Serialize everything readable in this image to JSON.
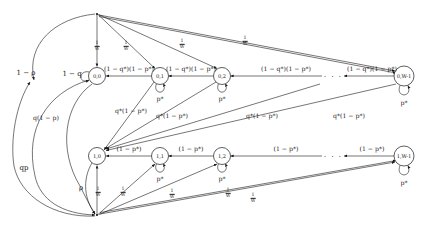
{
  "diagram": {
    "type": "state-transition-diagram",
    "ink_color": "#1a1a1a",
    "background": "#ffffff",
    "rows": [
      {
        "row_index": 0,
        "states": [
          {
            "id": "s00",
            "label": "0,0",
            "cx": 97,
            "cy": 76,
            "r": 8.5
          },
          {
            "id": "s01",
            "label": "0,1",
            "cx": 160,
            "cy": 76,
            "r": 8.5
          },
          {
            "id": "s02",
            "label": "0,2",
            "cx": 222,
            "cy": 76,
            "r": 8.5
          },
          {
            "id": "s0W",
            "label": "0,W-1",
            "cx": 404,
            "cy": 76,
            "r": 10
          }
        ]
      },
      {
        "row_index": 1,
        "states": [
          {
            "id": "s10",
            "label": "1,0",
            "cx": 97,
            "cy": 156,
            "r": 8.5
          },
          {
            "id": "s11",
            "label": "1,1",
            "cx": 160,
            "cy": 156,
            "r": 8.5
          },
          {
            "id": "s12",
            "label": "1,2",
            "cx": 222,
            "cy": 156,
            "r": 8.5
          },
          {
            "id": "s1W",
            "label": "1,W-1",
            "cx": 404,
            "cy": 156,
            "r": 10
          }
        ]
      }
    ],
    "ellipsis": [
      {
        "id": "dots-top",
        "text": "· · ·",
        "x": 333,
        "y": 76
      },
      {
        "id": "dots-bottom",
        "text": "· · ·",
        "x": 333,
        "y": 156
      }
    ],
    "self_loops": [
      {
        "id": "loop-00",
        "state": "0,0",
        "label": "1 − q",
        "lx": 72,
        "ly": 74,
        "side": "left"
      },
      {
        "id": "loop-01",
        "state": "0,1",
        "label": "p*",
        "lx": 160,
        "ly": 98,
        "side": "below"
      },
      {
        "id": "loop-02",
        "state": "0,2",
        "label": "p*",
        "lx": 222,
        "ly": 98,
        "side": "below"
      },
      {
        "id": "loop-0W",
        "state": "0,W-1",
        "label": "p*",
        "lx": 404,
        "ly": 102,
        "side": "below"
      },
      {
        "id": "loop-11",
        "state": "1,1",
        "label": "p*",
        "lx": 160,
        "ly": 178,
        "side": "below"
      },
      {
        "id": "loop-12",
        "state": "1,2",
        "label": "p*",
        "lx": 222,
        "ly": 178,
        "side": "below"
      },
      {
        "id": "loop-1W",
        "state": "1,W-1",
        "label": "p*",
        "lx": 404,
        "ly": 182,
        "side": "below"
      }
    ],
    "row0_transitions": [
      {
        "id": "t-01-00",
        "from": "0,1",
        "to": "0,0",
        "label": "(1 − q*)(1 − p*)",
        "lx": 129,
        "ly": 68
      },
      {
        "id": "t-02-01",
        "from": "0,2",
        "to": "0,1",
        "label": "(1 − q*)(1 − p*)",
        "lx": 191,
        "ly": 68
      },
      {
        "id": "t-03-02",
        "from": "0,3",
        "to": "0,2",
        "label": "(1 − q*)(1 − p*)",
        "lx": 286,
        "ly": 68
      },
      {
        "id": "t-0W-dots",
        "from": "0,W-1",
        "to": "0,W-2",
        "label": "(1 − q*)(1 − p*)",
        "lx": 372,
        "ly": 68
      }
    ],
    "row1_transitions": [
      {
        "id": "t-11-10",
        "from": "1,1",
        "to": "1,0",
        "label": "(1 − p*)",
        "lx": 129,
        "ly": 148
      },
      {
        "id": "t-12-11",
        "from": "1,2",
        "to": "1,1",
        "label": "(1 − p*)",
        "lx": 191,
        "ly": 148
      },
      {
        "id": "t-13-12",
        "from": "1,3",
        "to": "1,2",
        "label": "(1 − p*)",
        "lx": 286,
        "ly": 148
      },
      {
        "id": "t-1W-dots",
        "from": "1,W-1",
        "to": "1,W-2",
        "label": "(1 − p*)",
        "lx": 372,
        "ly": 148
      }
    ],
    "diagonal_transitions": [
      {
        "id": "d-01-10",
        "label": "q*(1 − p*)",
        "lx": 131,
        "ly": 110
      },
      {
        "id": "d-02-10",
        "label": "q*(1 − p*)",
        "lx": 172,
        "ly": 115
      },
      {
        "id": "d-03-10",
        "label": "q*(1 − p*)",
        "lx": 262,
        "ly": 115
      },
      {
        "id": "d-0W-10",
        "label": "q*(1 − p*)",
        "lx": 349,
        "ly": 115
      }
    ],
    "outer_labels": [
      {
        "id": "lbl-1-minus-rho",
        "label": "1 − ρ",
        "lx": 26,
        "ly": 73
      },
      {
        "id": "lbl-qp",
        "label": "qp",
        "lx": 24,
        "ly": 168
      },
      {
        "id": "lbl-rho",
        "label": "ρ",
        "lx": 81,
        "ly": 188
      },
      {
        "id": "lbl-q1mp",
        "label": "q(1 − p)",
        "lx": 46,
        "ly": 117
      }
    ],
    "fraction_labels_top": [
      {
        "id": "frac-top-1",
        "num": "1",
        "den": "W",
        "x": 97,
        "y": 46
      },
      {
        "id": "frac-top-2",
        "num": "1",
        "den": "W",
        "x": 126,
        "y": 46
      },
      {
        "id": "frac-top-3",
        "num": "1",
        "den": "W",
        "x": 182,
        "y": 44
      },
      {
        "id": "frac-top-4",
        "num": "1",
        "den": "W",
        "x": 245,
        "y": 41
      }
    ],
    "fraction_labels_bottom": [
      {
        "id": "frac-bot-1",
        "num": "1",
        "den": "W",
        "x": 98,
        "y": 192
      },
      {
        "id": "frac-bot-2",
        "num": "1",
        "den": "W",
        "x": 123,
        "y": 192
      },
      {
        "id": "frac-bot-3",
        "num": "1",
        "den": "W",
        "x": 172,
        "y": 194
      },
      {
        "id": "frac-bot-4",
        "num": "1",
        "den": "W",
        "x": 228,
        "y": 193
      },
      {
        "id": "frac-bot-5",
        "num": "1",
        "den": "W",
        "x": 253,
        "y": 198
      }
    ],
    "hub_points": [
      {
        "id": "hub-top",
        "x": 97,
        "y": 14
      },
      {
        "id": "hub-bottom",
        "x": 97,
        "y": 215
      }
    ]
  }
}
